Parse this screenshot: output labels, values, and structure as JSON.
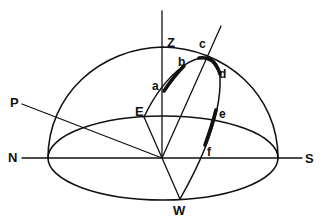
{
  "diagram": {
    "type": "celestial-sphere-sun-path",
    "colors": {
      "ink": "#111111",
      "background": "#ffffff"
    },
    "labels": {
      "zenith": "Z",
      "pole": "P",
      "north": "N",
      "south": "S",
      "east": "E",
      "west": "W",
      "a": "a",
      "b": "b",
      "c": "c",
      "d": "d",
      "e": "e",
      "f": "f"
    }
  }
}
